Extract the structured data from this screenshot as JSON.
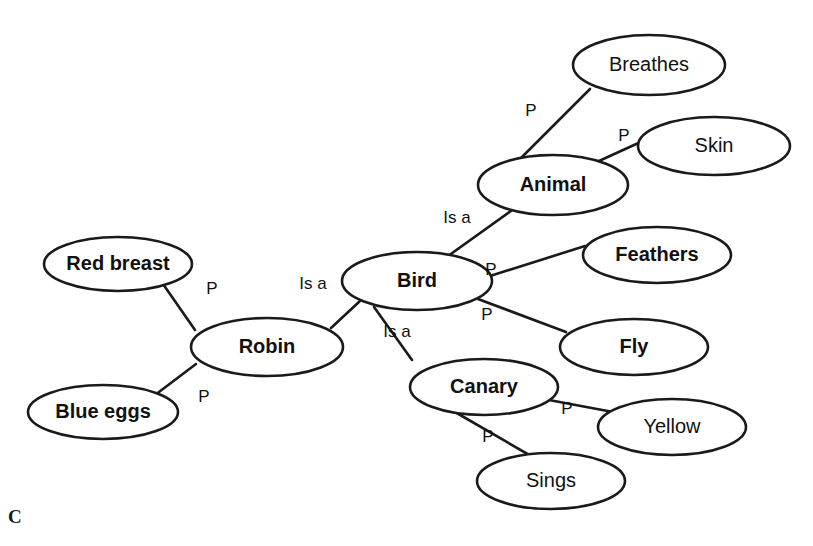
{
  "diagram": {
    "type": "semantic-network",
    "panel_label": "C",
    "nodes": [
      {
        "id": "breathes",
        "label": "Breathes",
        "bold": false,
        "cx": 649,
        "cy": 65,
        "rx": 76,
        "ry": 30
      },
      {
        "id": "skin",
        "label": "Skin",
        "bold": false,
        "cx": 714,
        "cy": 146,
        "rx": 76,
        "ry": 29
      },
      {
        "id": "animal",
        "label": "Animal",
        "bold": true,
        "cx": 553,
        "cy": 185,
        "rx": 75,
        "ry": 30
      },
      {
        "id": "feathers",
        "label": "Feathers",
        "bold": true,
        "cx": 657,
        "cy": 255,
        "rx": 74,
        "ry": 28
      },
      {
        "id": "bird",
        "label": "Bird",
        "bold": true,
        "cx": 417,
        "cy": 281,
        "rx": 75,
        "ry": 29
      },
      {
        "id": "red-breast",
        "label": "Red breast",
        "bold": true,
        "cx": 118,
        "cy": 264,
        "rx": 74,
        "ry": 27
      },
      {
        "id": "robin",
        "label": "Robin",
        "bold": true,
        "cx": 267,
        "cy": 347,
        "rx": 76,
        "ry": 29
      },
      {
        "id": "fly",
        "label": "Fly",
        "bold": true,
        "cx": 634,
        "cy": 347,
        "rx": 74,
        "ry": 28
      },
      {
        "id": "blue-eggs",
        "label": "Blue eggs",
        "bold": true,
        "cx": 103,
        "cy": 412,
        "rx": 75,
        "ry": 27
      },
      {
        "id": "canary",
        "label": "Canary",
        "bold": true,
        "cx": 484,
        "cy": 387,
        "rx": 74,
        "ry": 28
      },
      {
        "id": "yellow",
        "label": "Yellow",
        "bold": false,
        "cx": 672,
        "cy": 427,
        "rx": 74,
        "ry": 28
      },
      {
        "id": "sings",
        "label": "Sings",
        "bold": false,
        "cx": 551,
        "cy": 481,
        "rx": 74,
        "ry": 28
      }
    ],
    "edges": [
      {
        "id": "animal-breathes",
        "from": "animal",
        "to": "breathes",
        "label": "P",
        "x1": 519,
        "y1": 160,
        "x2": 590,
        "y2": 89,
        "lx": 531,
        "ly": 112
      },
      {
        "id": "animal-skin",
        "from": "animal",
        "to": "skin",
        "label": "P",
        "x1": 588,
        "y1": 166,
        "x2": 645,
        "y2": 140,
        "lx": 624,
        "ly": 137
      },
      {
        "id": "bird-animal",
        "from": "bird",
        "to": "animal",
        "label": "Is a",
        "x1": 448,
        "y1": 256,
        "x2": 511,
        "y2": 211,
        "lx": 457,
        "ly": 219
      },
      {
        "id": "bird-feathers",
        "from": "bird",
        "to": "feathers",
        "label": "P",
        "x1": 490,
        "y1": 276,
        "x2": 585,
        "y2": 246,
        "lx": 491,
        "ly": 271
      },
      {
        "id": "bird-fly",
        "from": "bird",
        "to": "fly",
        "label": "P",
        "x1": 478,
        "y1": 299,
        "x2": 566,
        "y2": 332,
        "lx": 487,
        "ly": 316
      },
      {
        "id": "robin-bird",
        "from": "robin",
        "to": "bird",
        "label": "Is a",
        "x1": 331,
        "y1": 328,
        "x2": 360,
        "y2": 301,
        "lx": 313,
        "ly": 285
      },
      {
        "id": "canary-bird",
        "from": "canary",
        "to": "bird",
        "label": "Is a",
        "x1": 412,
        "y1": 360,
        "x2": 374,
        "y2": 307,
        "lx": 397,
        "ly": 333
      },
      {
        "id": "robin-redbreast",
        "from": "robin",
        "to": "red-breast",
        "label": "P",
        "x1": 195,
        "y1": 330,
        "x2": 163,
        "y2": 284,
        "lx": 212,
        "ly": 290
      },
      {
        "id": "robin-blueeggs",
        "from": "robin",
        "to": "blue-eggs",
        "label": "P",
        "x1": 196,
        "y1": 364,
        "x2": 155,
        "y2": 395,
        "lx": 204,
        "ly": 398
      },
      {
        "id": "canary-yellow",
        "from": "canary",
        "to": "yellow",
        "label": "P",
        "x1": 549,
        "y1": 400,
        "x2": 613,
        "y2": 412,
        "lx": 567,
        "ly": 410
      },
      {
        "id": "canary-sings",
        "from": "canary",
        "to": "sings",
        "label": "P",
        "x1": 455,
        "y1": 412,
        "x2": 531,
        "y2": 456,
        "lx": 488,
        "ly": 438
      }
    ]
  }
}
